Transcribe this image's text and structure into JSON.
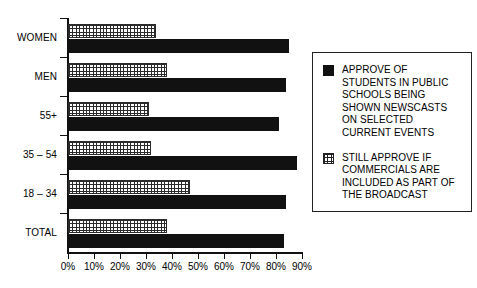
{
  "chart_data": {
    "type": "bar",
    "orientation": "horizontal",
    "title": "",
    "subtitle": "",
    "xlabel": "",
    "ylabel": "",
    "xlim": [
      0,
      90
    ],
    "grid": false,
    "legend_position": "right",
    "categories": [
      "TOTAL",
      "18 – 34",
      "35 – 54",
      "55+",
      "MEN",
      "WOMEN"
    ],
    "tick_labels": [
      "0%",
      "10%",
      "20%",
      "30%",
      "40%",
      "50%",
      "60%",
      "70%",
      "80%",
      "90%"
    ],
    "tick_values": [
      0,
      10,
      20,
      30,
      40,
      50,
      60,
      70,
      80,
      90
    ],
    "series": [
      {
        "name": "APPROVE OF STUDENTS IN PUBLIC SCHOOLS BEING SHOWN NEWSCASTS ON SELECTED CURRENT EVENTS",
        "style": "solid",
        "color": "#111111",
        "values": [
          83,
          84,
          88,
          81,
          84,
          85
        ]
      },
      {
        "name": "STILL APPROVE IF COMMERCIALS ARE INCLUDED AS PART OF THE BROADCAST",
        "style": "crosshatch",
        "color": "#2b2b2b",
        "values": [
          38,
          47,
          32,
          31,
          38,
          34
        ]
      }
    ]
  },
  "legend": {
    "entries": [
      {
        "swatch": "solid-swatch",
        "label": "APPROVE OF STUDENTS IN PUBLIC SCHOOLS BEING SHOWN NEWSCASTS ON SELECTED CURRENT EVENTS"
      },
      {
        "swatch": "crosshatch-swatch",
        "label": "STILL APPROVE IF COMMERCIALS ARE INCLUDED AS PART OF THE BROADCAST"
      }
    ]
  },
  "axis": {
    "category_labels": [
      "WOMEN",
      "MEN",
      "55+",
      "35 – 54",
      "18 – 34",
      "TOTAL"
    ]
  }
}
